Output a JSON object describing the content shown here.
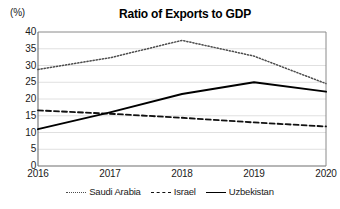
{
  "chart_data": {
    "type": "line",
    "title": "Ratio of Exports to GDP",
    "unit_label": "(%)",
    "xlabel": "",
    "ylabel": "",
    "categories": [
      "2016",
      "2017",
      "2018",
      "2019",
      "2020"
    ],
    "x": [
      2016,
      2017,
      2018,
      2019,
      2020
    ],
    "ylim": [
      0,
      40
    ],
    "yticks": [
      0,
      5,
      10,
      15,
      20,
      25,
      30,
      35,
      40
    ],
    "ytick_labels": [
      "0",
      "5",
      "10",
      "15",
      "20",
      "25",
      "30",
      "35",
      "40"
    ],
    "grid": true,
    "grid_axis": "y",
    "legend_position": "bottom",
    "series": [
      {
        "name": "Saudi Arabia",
        "style": "dotted",
        "color": "#4d4d4d",
        "values": [
          28.8,
          32.3,
          37.5,
          32.8,
          24.6
        ]
      },
      {
        "name": "Israel",
        "style": "dashed",
        "color": "#111111",
        "values": [
          16.6,
          15.6,
          14.4,
          13.0,
          11.8
        ]
      },
      {
        "name": "Uzbekistan",
        "style": "solid",
        "color": "#000000",
        "values": [
          11.0,
          16.0,
          21.5,
          25.0,
          22.2
        ]
      }
    ]
  },
  "legend": {
    "items": [
      {
        "label": "Saudi Arabia"
      },
      {
        "label": "Israel"
      },
      {
        "label": "Uzbekistan"
      }
    ]
  }
}
